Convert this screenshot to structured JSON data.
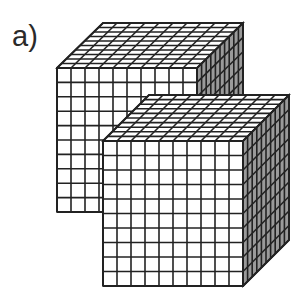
{
  "figure": {
    "label": "a)",
    "cubes": [
      {
        "name": "back-cube",
        "front_top_left": [
          57,
          68
        ],
        "size": 140,
        "height": 144,
        "depth_dx": 46,
        "depth_dy": -45,
        "divisions": 10
      },
      {
        "name": "front-cube",
        "front_top_left": [
          103,
          141
        ],
        "size": 140,
        "height": 145,
        "depth_dx": 46,
        "depth_dy": -46,
        "divisions": 10
      }
    ],
    "colors": {
      "line": "#222222",
      "front_face": "#ffffff",
      "top_face": "#ffffff",
      "side_face": "#9a9a9a"
    }
  }
}
